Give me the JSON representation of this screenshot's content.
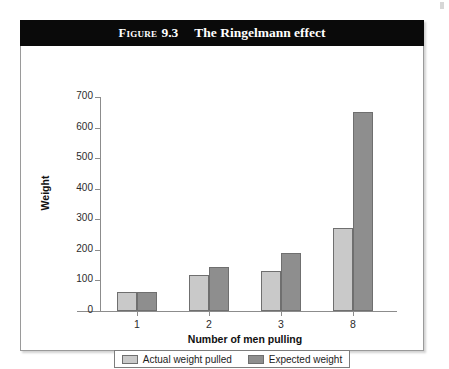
{
  "figure": {
    "label": "Figure",
    "number": "9.3",
    "caption": "The Ringelmann effect"
  },
  "legend": {
    "entries": [
      {
        "name": "actual",
        "label": "Actual weight pulled",
        "color": "#c9c9c9"
      },
      {
        "name": "expected",
        "label": "Expected weight",
        "color": "#8e8e8e"
      }
    ]
  },
  "axes": {
    "y_title": "Weight",
    "x_title": "Number of men pulling",
    "y_ticks": [
      "700",
      "600",
      "500",
      "400",
      "300",
      "200",
      "100",
      "0"
    ],
    "x_ticks": [
      "1",
      "2",
      "3",
      "8"
    ]
  },
  "chart_data": {
    "type": "bar",
    "title": "Figure 9.3  The Ringelmann effect",
    "xlabel": "Number of men pulling",
    "ylabel": "Weight",
    "categories": [
      "1",
      "2",
      "3",
      "8"
    ],
    "series": [
      {
        "name": "Actual weight pulled",
        "color": "#c9c9c9",
        "values": [
          63,
          118,
          130,
          272
        ]
      },
      {
        "name": "Expected weight",
        "color": "#8e8e8e",
        "values": [
          63,
          143,
          190,
          650
        ]
      }
    ],
    "ylim": [
      0,
      700
    ],
    "ytick_step": 100,
    "grid": false,
    "legend_position": "bottom"
  }
}
